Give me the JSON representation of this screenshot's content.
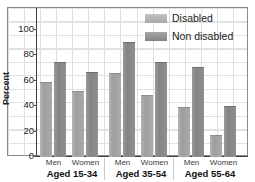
{
  "figure": {
    "title_fragment": "",
    "background": "#ffffff",
    "frame_color": "#8a8a8a"
  },
  "legend": {
    "position": "top-right",
    "entries": [
      {
        "label": "Disabled",
        "color": "#a8a8a8",
        "swatch": "disabled-swatch"
      },
      {
        "label": "Non disabled",
        "color": "#848484",
        "swatch": "non-disabled-swatch"
      }
    ]
  },
  "axes": {
    "ylabel": "Percent",
    "yticks": [
      0,
      20,
      40,
      60,
      80,
      100
    ],
    "ylim": [
      0,
      110
    ],
    "xlabel": "",
    "grid": true
  },
  "chart_data": {
    "type": "bar",
    "title": "",
    "xlabel": "",
    "ylabel": "Percent",
    "ylim": [
      0,
      110
    ],
    "yticks": [
      0,
      20,
      40,
      60,
      80,
      100
    ],
    "grid": true,
    "legend_position": "top-right",
    "groups": [
      {
        "group_label": "Aged 15-34",
        "categories": [
          "Men",
          "Women"
        ],
        "bars": [
          {
            "category": "Men",
            "series": "Disabled",
            "value": 59
          },
          {
            "category": "Men",
            "series": "Non disabled",
            "value": 75
          },
          {
            "category": "Women",
            "series": "Disabled",
            "value": 52
          },
          {
            "category": "Women",
            "series": "Non disabled",
            "value": 67
          }
        ]
      },
      {
        "group_label": "Aged 35-54",
        "categories": [
          "Men",
          "Women"
        ],
        "bars": [
          {
            "category": "Men",
            "series": "Disabled",
            "value": 66
          },
          {
            "category": "Men",
            "series": "Non disabled",
            "value": 90
          },
          {
            "category": "Women",
            "series": "Disabled",
            "value": 49
          },
          {
            "category": "Women",
            "series": "Non disabled",
            "value": 75
          }
        ]
      },
      {
        "group_label": "Aged 55-64",
        "categories": [
          "Men",
          "Women"
        ],
        "bars": [
          {
            "category": "Men",
            "series": "Disabled",
            "value": 39
          },
          {
            "category": "Men",
            "series": "Non disabled",
            "value": 71
          },
          {
            "category": "Women",
            "series": "Disabled",
            "value": 17
          },
          {
            "category": "Women",
            "series": "Non disabled",
            "value": 40
          }
        ]
      }
    ],
    "categories": [
      "Aged 15-34 Men",
      "Aged 15-34 Women",
      "Aged 35-54 Men",
      "Aged 35-54 Women",
      "Aged 55-64 Men",
      "Aged 55-64 Women"
    ],
    "series": [
      {
        "name": "Disabled",
        "values": [
          59,
          52,
          66,
          49,
          39,
          17
        ]
      },
      {
        "name": "Non disabled",
        "values": [
          75,
          67,
          90,
          75,
          71,
          40
        ]
      }
    ]
  }
}
